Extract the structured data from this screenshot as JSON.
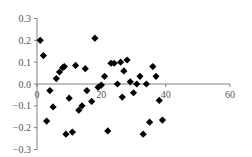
{
  "chart_data": {
    "type": "scatter",
    "title": "",
    "xlabel": "",
    "ylabel": "",
    "xlim": [
      0,
      60
    ],
    "ylim": [
      -0.3,
      0.3
    ],
    "grid": false,
    "legend": null,
    "x_ticks": [
      "0",
      "20",
      "40",
      "60"
    ],
    "y_ticks": [
      "0.3",
      "0.2",
      "0.1",
      "0.0",
      "-0.1",
      "-0.2",
      "-0.3"
    ],
    "marker": "diamond",
    "marker_color": "#000000",
    "series": [
      {
        "name": "",
        "points": [
          [
            1,
            0.2
          ],
          [
            2,
            0.13
          ],
          [
            3,
            -0.17
          ],
          [
            4,
            -0.03
          ],
          [
            5,
            -0.105
          ],
          [
            6,
            0.025
          ],
          [
            7,
            0.055
          ],
          [
            8,
            0.075
          ],
          [
            8.5,
            0.08
          ],
          [
            9,
            -0.23
          ],
          [
            10,
            -0.065
          ],
          [
            11,
            -0.22
          ],
          [
            12,
            0.085
          ],
          [
            13,
            -0.12
          ],
          [
            14,
            -0.1
          ],
          [
            15,
            0.07
          ],
          [
            15.5,
            -0.03
          ],
          [
            17,
            -0.08
          ],
          [
            18,
            0.21
          ],
          [
            19,
            -0.015
          ],
          [
            20,
            -0.005
          ],
          [
            21,
            0.035
          ],
          [
            22,
            -0.215
          ],
          [
            23,
            0.095
          ],
          [
            24,
            0.095
          ],
          [
            25,
            0.0
          ],
          [
            26,
            0.1
          ],
          [
            26.5,
            -0.06
          ],
          [
            27,
            0.06
          ],
          [
            28,
            0.11
          ],
          [
            29,
            0.01
          ],
          [
            30,
            -0.04
          ],
          [
            31,
            0.0
          ],
          [
            32,
            0.035
          ],
          [
            33,
            -0.23
          ],
          [
            34,
            0.0
          ],
          [
            35,
            -0.175
          ],
          [
            36,
            0.08
          ],
          [
            37,
            0.035
          ],
          [
            38,
            -0.075
          ],
          [
            39,
            -0.165
          ]
        ]
      }
    ]
  }
}
